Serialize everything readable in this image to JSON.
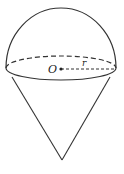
{
  "figure": {
    "labels": {
      "center": "O",
      "radius": "r"
    },
    "colors": {
      "stroke": "#333333",
      "background": "#ffffff"
    }
  }
}
